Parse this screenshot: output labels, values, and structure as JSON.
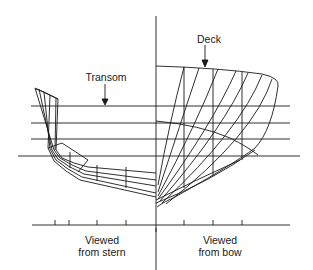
{
  "figure": {
    "type": "ship body plan",
    "labels": {
      "transom": "Transom",
      "deck": "Deck",
      "stern_view_line1": "Viewed",
      "stern_view_line2": "from stern",
      "bow_view_line1": "Viewed",
      "bow_view_line2": "from bow"
    },
    "colors": {
      "line": "#1a1a1a",
      "background": "#ffffff"
    },
    "waterlines_y": [
      106,
      123,
      139,
      156
    ],
    "baseline_y": 225,
    "centerline_x": 156,
    "baseline_ticks_stern_x": [
      55,
      69,
      97,
      126
    ],
    "baseline_ticks_bow_x": [
      184,
      213,
      242
    ]
  }
}
